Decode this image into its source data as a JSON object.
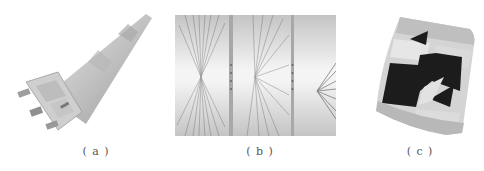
{
  "figure": {
    "panels": [
      {
        "id": "a",
        "label": "( a )",
        "content": "3D model of cone-shaped rocket body with nozzles"
      },
      {
        "id": "b",
        "label": "( b )",
        "content": "Three-frame ray/streak visualization sequence"
      },
      {
        "id": "c",
        "label": "( c )",
        "content": "Curved mesh surface with dark/light patterned faces"
      }
    ]
  },
  "colors": {
    "background": "#ffffff",
    "panel_b_gray": "#c9c9c9",
    "dark_face": "#1c1c1c",
    "light_face": "#e0e0e0",
    "mid_face": "#bdbdbd"
  }
}
